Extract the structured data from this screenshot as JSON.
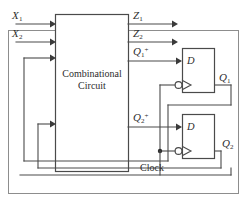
{
  "figure": {
    "width": 247,
    "height": 201
  },
  "colors": {
    "wire": "#4a4a4a",
    "frame": "#8d8d8d",
    "text": "#2e2e2e",
    "background": "#ffffff",
    "junction": "#2b2b2b"
  },
  "blocks": {
    "combinational": {
      "line1": "Combinational",
      "line2": "Circuit"
    },
    "ff1": {
      "input_label": "D",
      "output_label_base": "Q",
      "output_label_sub": "1"
    },
    "ff2": {
      "input_label": "D",
      "output_label_base": "Q",
      "output_label_sub": "2"
    }
  },
  "signals": {
    "x1": {
      "base": "X",
      "sub": "1"
    },
    "x2": {
      "base": "X",
      "sub": "2"
    },
    "z1": {
      "base": "Z",
      "sub": "1"
    },
    "z2": {
      "base": "Z",
      "sub": "2"
    },
    "q1next": {
      "base": "Q",
      "sub": "1",
      "sup": "+"
    },
    "q2next": {
      "base": "Q",
      "sub": "2",
      "sup": "+"
    },
    "q1": {
      "base": "Q",
      "sub": "1"
    },
    "q2": {
      "base": "Q",
      "sub": "2"
    },
    "clock": {
      "label": "Clock"
    }
  }
}
